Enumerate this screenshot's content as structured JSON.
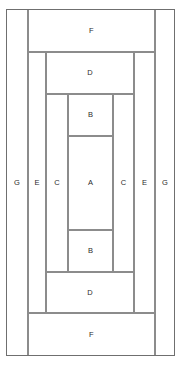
{
  "diagram": {
    "canvas": {
      "width": 181,
      "height": 366
    },
    "colors": {
      "line": "#8c8c8c",
      "outer_line": "#6f6f6f",
      "label": "#2b2b2b",
      "background": "#ffffff"
    },
    "labels": {
      "a": "A",
      "b_top": "B",
      "b_bottom": "B",
      "c_left": "C",
      "c_right": "C",
      "d_top": "D",
      "d_bottom": "D",
      "e_left": "E",
      "e_right": "E",
      "f_top": "F",
      "f_bottom": "F",
      "g_left": "G",
      "g_right": "G"
    },
    "regions": [
      {
        "name": "g-left",
        "label": "G",
        "x": 6,
        "y": 9,
        "w": 22,
        "h": 347
      },
      {
        "name": "g-right",
        "label": "G",
        "x": 155,
        "y": 9,
        "w": 20,
        "h": 347
      },
      {
        "name": "f-top",
        "label": "F",
        "x": 28,
        "y": 9,
        "w": 127,
        "h": 43
      },
      {
        "name": "f-bottom",
        "label": "F",
        "x": 28,
        "y": 313,
        "w": 127,
        "h": 43
      },
      {
        "name": "e-left",
        "label": "E",
        "x": 28,
        "y": 52,
        "w": 18,
        "h": 261
      },
      {
        "name": "e-right",
        "label": "E",
        "x": 134,
        "y": 52,
        "w": 21,
        "h": 261
      },
      {
        "name": "d-top",
        "label": "D",
        "x": 46,
        "y": 52,
        "w": 88,
        "h": 42
      },
      {
        "name": "d-bottom",
        "label": "D",
        "x": 46,
        "y": 272,
        "w": 88,
        "h": 41
      },
      {
        "name": "c-left",
        "label": "C",
        "x": 46,
        "y": 94,
        "w": 22,
        "h": 178
      },
      {
        "name": "c-right",
        "label": "C",
        "x": 113,
        "y": 94,
        "w": 21,
        "h": 178
      },
      {
        "name": "b-top",
        "label": "B",
        "x": 68,
        "y": 94,
        "w": 45,
        "h": 42
      },
      {
        "name": "b-bottom",
        "label": "B",
        "x": 68,
        "y": 230,
        "w": 45,
        "h": 42
      },
      {
        "name": "a-center",
        "label": "A",
        "x": 68,
        "y": 136,
        "w": 45,
        "h": 94
      }
    ]
  }
}
